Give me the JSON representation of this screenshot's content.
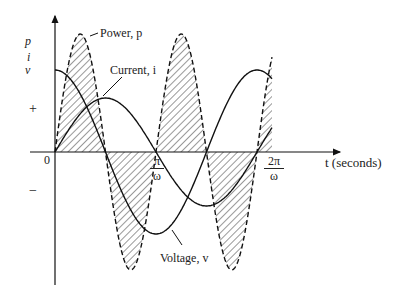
{
  "diagram": {
    "axis_labels": {
      "y_stack": [
        "p",
        "i",
        "v"
      ],
      "x": "t (seconds)",
      "origin": "0",
      "plus": "+",
      "minus": "−"
    },
    "ticks": [
      {
        "num": "π",
        "den": "ω"
      },
      {
        "num": "2π",
        "den": "ω"
      }
    ],
    "curves": {
      "power": "Power, p",
      "current": "Current, i",
      "voltage": "Voltage, v"
    }
  }
}
